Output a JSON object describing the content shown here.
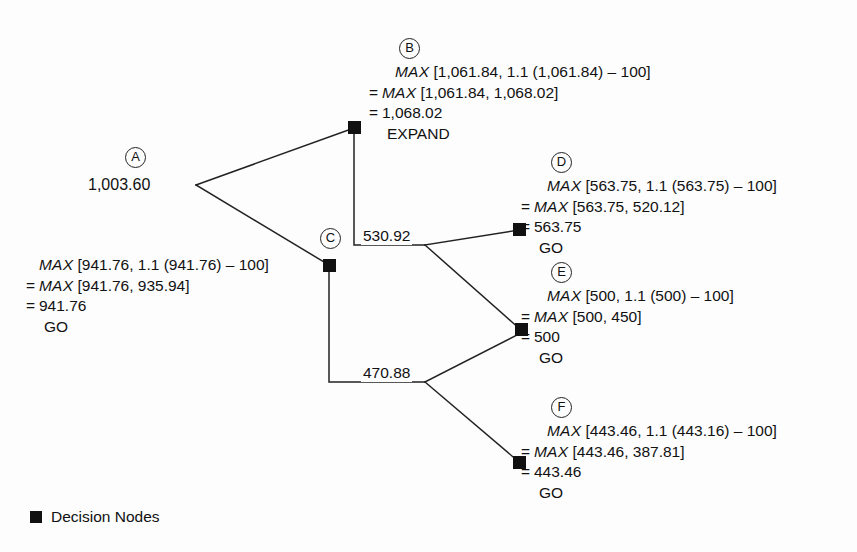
{
  "figure": {
    "title_faint": "",
    "legend": {
      "swatch_name": "decision-node-swatch",
      "label": "Decision Nodes"
    }
  },
  "nodes": [
    {
      "id": "A",
      "marker": "A",
      "value_text": "1,003.60",
      "lines": [],
      "decision": ""
    },
    {
      "id": "B",
      "marker": "B",
      "value_text": "",
      "lines": [
        {
          "eq": "",
          "expr": "MAX",
          "rest": " [1,061.84, 1.1 (1,061.84) – 100]"
        },
        {
          "eq": "=",
          "expr": "MAX",
          "rest": " [1,061.84, 1,068.02]"
        },
        {
          "eq": "=",
          "expr": "",
          "rest": "1,068.02"
        }
      ],
      "decision": "EXPAND"
    },
    {
      "id": "C",
      "marker": "C",
      "value_text": "",
      "lines": [
        {
          "eq": "",
          "expr": "MAX",
          "rest": " [941.76, 1.1 (941.76) – 100]"
        },
        {
          "eq": "=",
          "expr": "MAX",
          "rest": " [941.76, 935.94]"
        },
        {
          "eq": "=",
          "expr": "",
          "rest": "941.76"
        }
      ],
      "decision": "GO"
    },
    {
      "id": "D",
      "marker": "D",
      "value_text": "",
      "lines": [
        {
          "eq": "",
          "expr": "MAX",
          "rest": " [563.75, 1.1 (563.75) – 100]"
        },
        {
          "eq": "=",
          "expr": "MAX",
          "rest": " [563.75, 520.12]"
        },
        {
          "eq": "=",
          "expr": "",
          "rest": "563.75"
        }
      ],
      "decision": "GO"
    },
    {
      "id": "E",
      "marker": "E",
      "value_text": "",
      "lines": [
        {
          "eq": "",
          "expr": "MAX",
          "rest": " [500, 1.1 (500) – 100]"
        },
        {
          "eq": "=",
          "expr": "MAX",
          "rest": " [500, 450]"
        },
        {
          "eq": "=",
          "expr": "",
          "rest": "500"
        }
      ],
      "decision": "GO"
    },
    {
      "id": "F",
      "marker": "F",
      "value_text": "",
      "lines": [
        {
          "eq": "",
          "expr": "MAX",
          "rest": " [443.46, 1.1 (443.16) – 100]"
        },
        {
          "eq": "=",
          "expr": "MAX",
          "rest": " [443.46, 387.81]"
        },
        {
          "eq": "=",
          "expr": "",
          "rest": "443.46"
        }
      ],
      "decision": "GO"
    }
  ],
  "edge_labels": [
    {
      "name": "edge-label-upper",
      "text": "530.92"
    },
    {
      "name": "edge-label-lower",
      "text": "470.88"
    }
  ],
  "colors": {
    "node_fill": "#111111",
    "line": "#222222",
    "background": "#fdfdfd",
    "text": "#111111"
  }
}
